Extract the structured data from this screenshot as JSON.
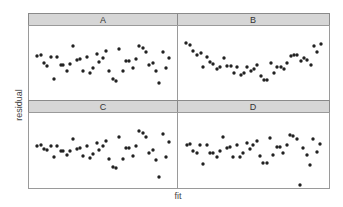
{
  "chart_data": {
    "type": "scatter",
    "title": "",
    "xlabel": "fit",
    "ylabel": "residual",
    "grid": false,
    "layout": "2x2 facets",
    "panels": [
      {
        "label": "A",
        "points": [
          [
            37,
            56
          ],
          [
            41,
            55
          ],
          [
            44,
            63
          ],
          [
            47,
            66
          ],
          [
            51,
            57
          ],
          [
            54,
            79
          ],
          [
            57,
            57
          ],
          [
            61,
            65
          ],
          [
            63,
            65
          ],
          [
            67,
            71
          ],
          [
            70,
            64
          ],
          [
            73,
            46
          ],
          [
            77,
            60
          ],
          [
            80,
            59
          ],
          [
            83,
            71
          ],
          [
            87,
            57
          ],
          [
            90,
            73
          ],
          [
            93,
            68
          ],
          [
            97,
            54
          ],
          [
            99,
            62
          ],
          [
            103,
            58
          ],
          [
            106,
            51
          ],
          [
            109,
            71
          ],
          [
            113,
            79
          ],
          [
            116,
            81
          ],
          [
            119,
            49
          ],
          [
            123,
            71
          ],
          [
            126,
            61
          ],
          [
            129,
            61
          ],
          [
            133,
            68
          ],
          [
            136,
            59
          ],
          [
            139,
            46
          ],
          [
            143,
            48
          ],
          [
            146,
            52
          ],
          [
            149,
            65
          ],
          [
            153,
            63
          ],
          [
            156,
            71
          ],
          [
            159,
            83
          ],
          [
            163,
            52
          ],
          [
            166,
            68
          ],
          [
            169,
            58
          ]
        ]
      },
      {
        "label": "B",
        "points": [
          [
            186,
            43
          ],
          [
            190,
            45
          ],
          [
            193,
            51
          ],
          [
            197,
            55
          ],
          [
            201,
            53
          ],
          [
            203,
            67
          ],
          [
            207,
            57
          ],
          [
            210,
            62
          ],
          [
            213,
            64
          ],
          [
            217,
            69
          ],
          [
            220,
            67
          ],
          [
            224,
            58
          ],
          [
            227,
            66
          ],
          [
            231,
            66
          ],
          [
            234,
            73
          ],
          [
            237,
            67
          ],
          [
            241,
            75
          ],
          [
            244,
            73
          ],
          [
            247,
            67
          ],
          [
            251,
            71
          ],
          [
            254,
            69
          ],
          [
            257,
            65
          ],
          [
            261,
            76
          ],
          [
            264,
            80
          ],
          [
            267,
            80
          ],
          [
            271,
            63
          ],
          [
            274,
            73
          ],
          [
            277,
            67
          ],
          [
            281,
            67
          ],
          [
            284,
            69
          ],
          [
            287,
            63
          ],
          [
            291,
            56
          ],
          [
            294,
            55
          ],
          [
            297,
            55
          ],
          [
            301,
            61
          ],
          [
            304,
            58
          ],
          [
            307,
            60
          ],
          [
            311,
            65
          ],
          [
            314,
            46
          ],
          [
            317,
            52
          ],
          [
            321,
            44
          ]
        ]
      },
      {
        "label": "C",
        "points": [
          [
            37,
            146
          ],
          [
            41,
            145
          ],
          [
            44,
            149
          ],
          [
            47,
            150
          ],
          [
            51,
            146
          ],
          [
            54,
            157
          ],
          [
            57,
            146
          ],
          [
            61,
            151
          ],
          [
            63,
            151
          ],
          [
            67,
            155
          ],
          [
            70,
            151
          ],
          [
            73,
            139
          ],
          [
            77,
            149
          ],
          [
            80,
            148
          ],
          [
            83,
            156
          ],
          [
            87,
            146
          ],
          [
            90,
            158
          ],
          [
            93,
            154
          ],
          [
            97,
            143
          ],
          [
            99,
            150
          ],
          [
            103,
            146
          ],
          [
            106,
            141
          ],
          [
            109,
            159
          ],
          [
            113,
            167
          ],
          [
            116,
            168
          ],
          [
            119,
            137
          ],
          [
            123,
            159
          ],
          [
            126,
            148
          ],
          [
            129,
            148
          ],
          [
            133,
            156
          ],
          [
            136,
            146
          ],
          [
            139,
            131
          ],
          [
            143,
            133
          ],
          [
            146,
            137
          ],
          [
            149,
            153
          ],
          [
            153,
            150
          ],
          [
            156,
            160
          ],
          [
            159,
            177
          ],
          [
            163,
            134
          ],
          [
            166,
            157
          ],
          [
            169,
            142
          ]
        ]
      },
      {
        "label": "D",
        "points": [
          [
            187,
            145
          ],
          [
            190,
            144
          ],
          [
            193,
            151
          ],
          [
            197,
            153
          ],
          [
            200,
            145
          ],
          [
            203,
            164
          ],
          [
            207,
            145
          ],
          [
            210,
            153
          ],
          [
            213,
            153
          ],
          [
            217,
            157
          ],
          [
            220,
            151
          ],
          [
            223,
            137
          ],
          [
            227,
            148
          ],
          [
            230,
            147
          ],
          [
            233,
            157
          ],
          [
            237,
            145
          ],
          [
            240,
            157
          ],
          [
            243,
            153
          ],
          [
            247,
            143
          ],
          [
            250,
            149
          ],
          [
            253,
            145
          ],
          [
            257,
            141
          ],
          [
            260,
            156
          ],
          [
            263,
            163
          ],
          [
            267,
            163
          ],
          [
            270,
            138
          ],
          [
            273,
            155
          ],
          [
            277,
            147
          ],
          [
            280,
            147
          ],
          [
            283,
            153
          ],
          [
            287,
            145
          ],
          [
            290,
            135
          ],
          [
            293,
            136
          ],
          [
            297,
            139
          ],
          [
            300,
            185
          ],
          [
            303,
            148
          ],
          [
            307,
            155
          ],
          [
            310,
            165
          ],
          [
            313,
            139
          ],
          [
            317,
            152
          ],
          [
            320,
            144
          ]
        ]
      }
    ],
    "note": "points given in screen pixel coordinates (no axis ticks shown)"
  },
  "labels": {
    "x": "fit",
    "y": "residual",
    "A": "A",
    "B": "B",
    "C": "C",
    "D": "D"
  }
}
